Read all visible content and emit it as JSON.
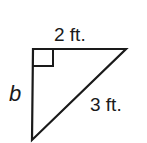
{
  "diagram": {
    "type": "right-triangle",
    "labels": {
      "top_leg": "2 ft.",
      "hypotenuse": "3 ft.",
      "left_leg": "b"
    },
    "right_angle_marker": "square",
    "colors": {
      "stroke": "#1a1a1a",
      "background": "#ffffff"
    }
  }
}
